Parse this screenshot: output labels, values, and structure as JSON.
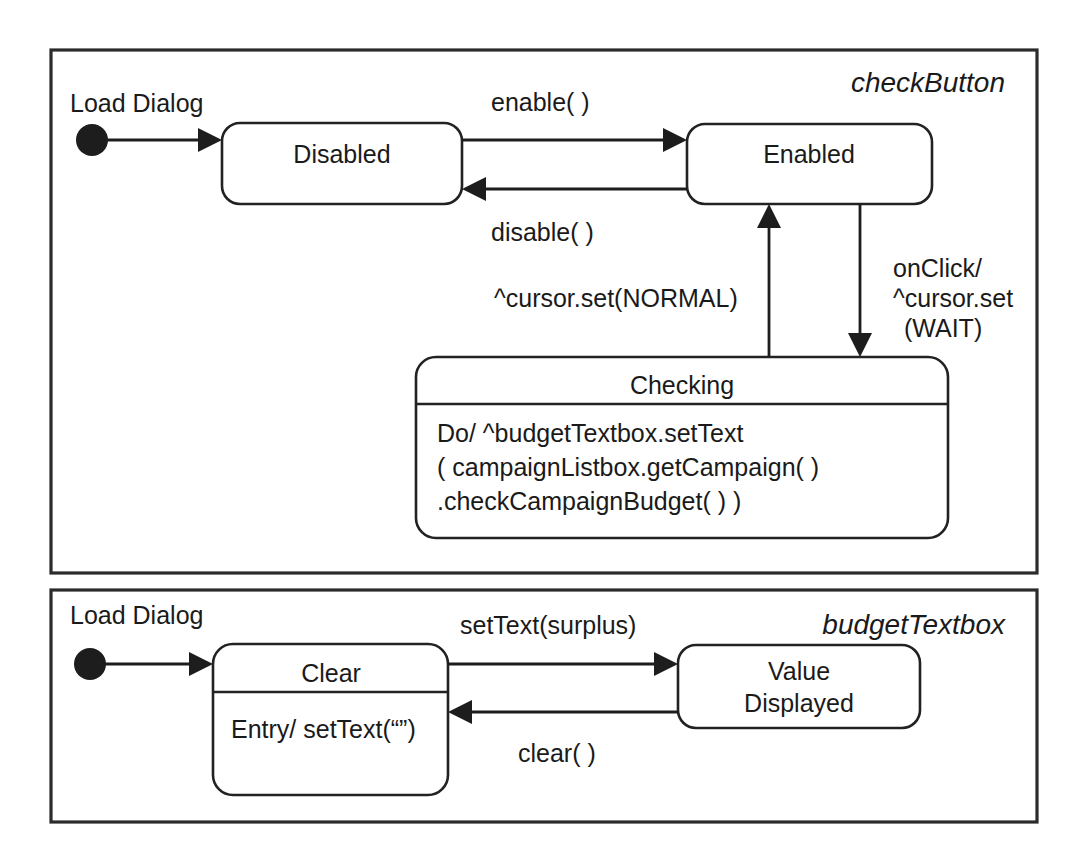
{
  "diagram": {
    "kind": "uml-state-machine",
    "background_color": "#ffffff",
    "line_color": "#1d1d1d"
  },
  "panels": [
    {
      "id": "checkButton",
      "title": "checkButton",
      "initial": {
        "label": "Load Dialog"
      },
      "states": [
        {
          "id": "disabled",
          "name": "Disabled",
          "compartments": []
        },
        {
          "id": "enabled",
          "name": "Enabled",
          "compartments": []
        },
        {
          "id": "checking",
          "name": "Checking",
          "compartments": [
            "Do/ ^budgetTextbox.setText",
            "( campaignListbox.getCampaign( )",
            ".checkCampaignBudget( ) )"
          ]
        }
      ],
      "transitions": [
        {
          "id": "t-init-disabled",
          "from": "initial",
          "to": "disabled",
          "label": ""
        },
        {
          "id": "t-enable",
          "from": "disabled",
          "to": "enabled",
          "label": "enable( )"
        },
        {
          "id": "t-disable",
          "from": "enabled",
          "to": "disabled",
          "label": "disable( )"
        },
        {
          "id": "t-checking-enabled",
          "from": "checking",
          "to": "enabled",
          "label": "^cursor.set(NORMAL)"
        },
        {
          "id": "t-enabled-checking",
          "from": "enabled",
          "to": "checking",
          "label_lines": [
            "onClick/",
            "^cursor.set",
            "(WAIT)"
          ]
        }
      ]
    },
    {
      "id": "budgetTextbox",
      "title": "budgetTextbox",
      "initial": {
        "label": "Load Dialog"
      },
      "states": [
        {
          "id": "clear",
          "name": "Clear",
          "compartments": [
            "Entry/ setText(“”)"
          ]
        },
        {
          "id": "value-displayed",
          "name": "Value Displayed",
          "name_lines": [
            "Value",
            "Displayed"
          ],
          "compartments": []
        }
      ],
      "transitions": [
        {
          "id": "t2-init-clear",
          "from": "initial",
          "to": "clear",
          "label": ""
        },
        {
          "id": "t2-settext",
          "from": "clear",
          "to": "value-displayed",
          "label": "setText(surplus)"
        },
        {
          "id": "t2-clear",
          "from": "value-displayed",
          "to": "clear",
          "label": "clear( )"
        }
      ]
    }
  ]
}
